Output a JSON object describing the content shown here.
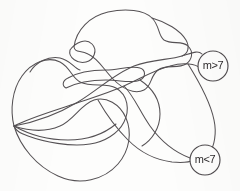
{
  "figure": {
    "kind": "hand-drawn-curve-diagram",
    "background_color": "#fdfdfc",
    "stroke_color": "#555154",
    "label_text_color": "#2e2b2d",
    "width": 240,
    "height": 191
  },
  "nodes": [
    {
      "id": "node-m-greater-7",
      "label": "m>7",
      "cx": 213,
      "cy": 66,
      "r": 15
    },
    {
      "id": "node-m-less-7",
      "label": "m<7",
      "cx": 205,
      "cy": 160,
      "r": 15
    }
  ],
  "curves": [
    {
      "id": "curve-upper-lobe",
      "d": "M 74 47 C 76 30, 90 16, 108 12 C 126 8, 144 10, 152 18 C 160 26, 158 36, 164 40 C 172 45, 182 40, 188 46 C 194 52, 192 60, 186 64 C 178 69, 166 64, 158 70 C 150 76, 152 86, 144 90 C 134 95, 122 88, 114 80 C 104 70, 98 58, 88 54 C 80 50, 75 53, 74 47 Z"
    },
    {
      "id": "curve-left-lobe",
      "d": "M 14 126 C 10 110, 12 90, 22 76 C 32 62, 48 56, 60 62 C 70 67, 72 78, 80 82 C 92 88, 106 82, 116 88 C 128 95, 130 110, 124 122 C 118 134, 104 142, 90 144 C 70 147, 44 142, 28 136 C 20 133, 16 131, 14 126 Z"
    },
    {
      "id": "curve-bottom-sweep",
      "d": "M 14 126 C 20 146, 36 166, 58 176 C 80 186, 104 180, 118 164 C 130 150, 132 132, 126 118 C 120 104, 106 96, 94 100 C 80 105, 74 120, 60 126 C 44 133, 26 130, 14 126 Z"
    },
    {
      "id": "curve-center-band",
      "d": "M 14 126 C 30 118, 50 112, 68 106 C 88 99, 106 94, 124 86 C 140 79, 154 70, 170 66 C 184 62, 196 64, 200 68"
    },
    {
      "id": "curve-diagonal-long",
      "d": "M 14 126 C 36 122, 58 114, 78 102 C 98 90, 114 74, 134 66 C 152 59, 170 60, 182 56 C 192 53, 198 50, 202 54"
    },
    {
      "id": "curve-right-tail-to-m-less",
      "d": "M 124 86 C 134 96, 140 112, 150 126 C 160 140, 174 152, 190 158"
    },
    {
      "id": "curve-right-descender",
      "d": "M 188 64 C 198 80, 210 100, 214 120 C 217 134, 214 146, 210 152"
    },
    {
      "id": "curve-lower-mid-hook",
      "d": "M 98 100 C 106 114, 116 128, 128 140 C 140 152, 156 160, 172 162 C 182 163, 190 162, 194 160"
    },
    {
      "id": "curve-inner-finger",
      "d": "M 66 88 C 78 82, 92 80, 106 80 C 120 80, 132 84, 140 80 C 146 77, 146 70, 140 68 C 132 65, 118 70, 106 70 C 92 70, 78 72, 68 78 C 62 81, 62 86, 66 88 Z"
    },
    {
      "id": "curve-upper-left-arc",
      "d": "M 30 72 C 36 62, 48 56, 60 58 C 70 60, 74 68, 80 70"
    },
    {
      "id": "curve-top-right-loop",
      "d": "M 152 18 C 166 22, 180 30, 186 40 C 190 47, 188 54, 182 56"
    },
    {
      "id": "curve-small-crossing-loop",
      "d": "M 70 50 C 76 42, 86 38, 92 44 C 98 50, 94 60, 86 62 C 78 64, 68 58, 70 50 Z"
    },
    {
      "id": "curve-bottom-inner",
      "d": "M 14 126 C 28 134, 48 140, 68 140 C 88 140, 104 134, 116 124"
    },
    {
      "id": "curve-mid-right-swoop",
      "d": "M 140 80 C 152 88, 160 100, 160 114 C 160 128, 152 140, 142 146"
    }
  ]
}
